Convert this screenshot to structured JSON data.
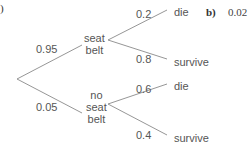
{
  "part_a": {
    "label": ")"
  },
  "part_b": {
    "label": "b)",
    "value": "0.02"
  },
  "tree": {
    "first_branches": [
      {
        "prob": "0.95",
        "node": [
          "seat",
          "belt"
        ]
      },
      {
        "prob": "0.05",
        "node": [
          "no",
          "seat",
          "belt"
        ]
      }
    ],
    "second_branches": {
      "seat_belt": [
        {
          "prob": "0.2",
          "outcome": "die"
        },
        {
          "prob": "0.8",
          "outcome": "survive"
        }
      ],
      "no_seat_belt": [
        {
          "prob": "0.6",
          "outcome": "die"
        },
        {
          "prob": "0.4",
          "outcome": "survive"
        }
      ]
    }
  },
  "colors": {
    "line": "#888888",
    "text": "#555555"
  }
}
